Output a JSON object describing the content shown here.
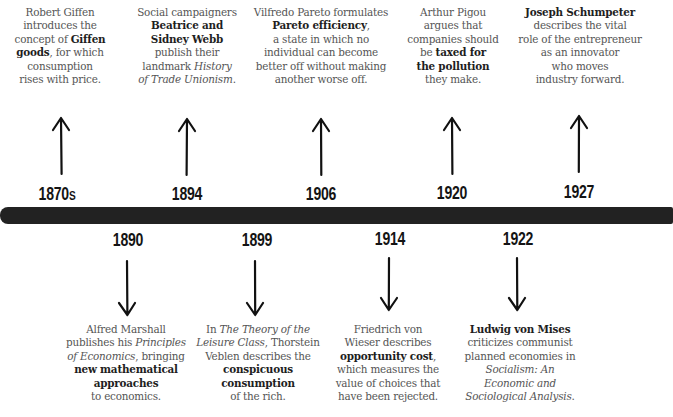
{
  "timeline": {
    "bar_color": "#222222",
    "events_above": [
      {
        "year": "1870",
        "year_suffix": "S",
        "parts": [
          {
            "t": "Robert Giffen introduces the concept of ",
            "s": "n"
          },
          {
            "t": "Giffen goods",
            "s": "b"
          },
          {
            "t": ", for which consumption rises with price.",
            "s": "n"
          }
        ],
        "lines": [
          "Robert Giffen",
          "introduces the",
          "concept of |Giffen|",
          "|goods|, for which",
          "consumption",
          "rises with price."
        ]
      },
      {
        "year": "1894",
        "lines": [
          "Social campaigners",
          "|Beatrice and|",
          "|Sidney Webb|",
          "publish their",
          "landmark _History_",
          "_of Trade Unionism_."
        ]
      },
      {
        "year": "1906",
        "lines": [
          "Vilfredo Pareto formulates",
          "|Pareto efficiency|,",
          "a state in which no",
          "individual can become",
          "better off without making",
          "another worse off."
        ]
      },
      {
        "year": "1920",
        "lines": [
          "Arthur Pigou",
          "argues that",
          "companies should",
          "be |taxed for|",
          "|the pollution|",
          "they make."
        ]
      },
      {
        "year": "1927",
        "lines": [
          "|Joseph Schumpeter|",
          "describes the vital",
          "role of the entrepreneur",
          "as an innovator",
          "who moves",
          "industry forward."
        ]
      }
    ],
    "events_below": [
      {
        "year": "1890",
        "lines": [
          "Alfred Marshall",
          "publishes his _Principles_",
          "_of Economics_, bringing",
          "|new mathematical|",
          "|approaches|",
          "to economics."
        ]
      },
      {
        "year": "1899",
        "lines": [
          "In _The Theory of the_",
          "_Leisure Class_, Thorstein",
          "Veblen describes the",
          "|conspicuous|",
          "|consumption|",
          "of the rich."
        ]
      },
      {
        "year": "1914",
        "lines": [
          "Friedrich von",
          "Wieser describes",
          "|opportunity cost|,",
          "which measures the",
          "value of choices that",
          "have been rejected."
        ]
      },
      {
        "year": "1922",
        "lines": [
          "|Ludwig von Mises|",
          "criticizes communist",
          "planned economies in",
          "_Socialism: An_",
          "_Economic and_",
          "_Sociological Analysis_."
        ]
      }
    ]
  }
}
